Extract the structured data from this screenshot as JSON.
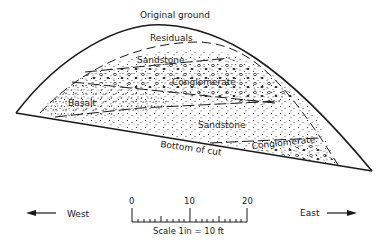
{
  "diagram": {
    "type": "geologic-cross-section",
    "labels": {
      "original_ground": "Original ground",
      "residuals": "Residuals",
      "sandstone_upper": "Sandstone",
      "conglomerate_upper": "Conglomerate",
      "basalt": "Basalt",
      "sandstone_lower": "Sandstone",
      "conglomerate_lower": "Conglomerate",
      "bottom_of_cut": "Bottom of cut"
    },
    "directions": {
      "west": "West",
      "east": "East"
    },
    "scale": {
      "ticks": [
        "0",
        "10",
        "20"
      ],
      "caption": "Scale 1in = 10 ft"
    },
    "colors": {
      "ink": "#1a1a1a",
      "background": "#ffffff"
    }
  }
}
